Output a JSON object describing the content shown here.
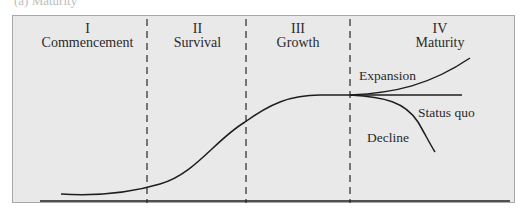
{
  "caption": "(a) Maturity",
  "diagram": {
    "stages": [
      {
        "numeral": "I",
        "name": "Commencement"
      },
      {
        "numeral": "II",
        "name": "Survival"
      },
      {
        "numeral": "III",
        "name": "Growth"
      },
      {
        "numeral": "IV",
        "name": "Maturity"
      }
    ],
    "branches": [
      {
        "label": "Expansion"
      },
      {
        "label": "Status quo"
      },
      {
        "label": "Decline"
      }
    ],
    "colors": {
      "panel_fill": "#e9e9e9",
      "panel_border": "#a8a8a8",
      "line": "#1e1e1e"
    }
  }
}
